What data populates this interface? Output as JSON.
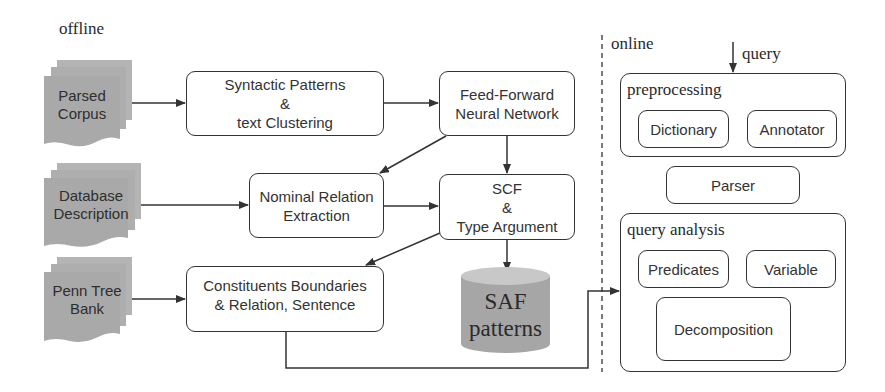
{
  "sections": {
    "offline_label": "offline",
    "online_label": "online"
  },
  "inputs": [
    {
      "id": "parsed-corpus",
      "lines": [
        "Parsed",
        "Corpus"
      ]
    },
    {
      "id": "database-description",
      "lines": [
        "Database",
        "Description"
      ]
    },
    {
      "id": "penn-tree-bank",
      "lines": [
        "Penn Tree",
        "Bank"
      ]
    }
  ],
  "offline_nodes": {
    "syntactic": {
      "lines": [
        "Syntactic Patterns",
        "&",
        "text Clustering"
      ]
    },
    "feedforward": {
      "lines": [
        "Feed-Forward",
        "Neural Network"
      ]
    },
    "nominal": {
      "lines": [
        "Nominal Relation",
        "Extraction"
      ]
    },
    "scf": {
      "lines": [
        "SCF",
        "&",
        "Type Argument"
      ]
    },
    "constituents": {
      "lines": [
        "Constituents Boundaries",
        "& Relation, Sentence"
      ]
    },
    "saf_db": {
      "lines": [
        "SAF",
        "patterns"
      ]
    }
  },
  "online": {
    "query_label": "query",
    "preprocessing": {
      "title": "preprocessing",
      "items": [
        "Dictionary",
        "Annotator"
      ]
    },
    "parser": "Parser",
    "query_analysis": {
      "title": "query analysis",
      "items": [
        "Predicates",
        "Variable",
        "Decomposition"
      ]
    }
  },
  "colors": {
    "stroke": "#333333",
    "doc_fill": "#a9a9a9",
    "doc_fill_back": "#b4b4b4",
    "db_fill": "#a6a6a6",
    "db_top": "#c8c8c8"
  }
}
